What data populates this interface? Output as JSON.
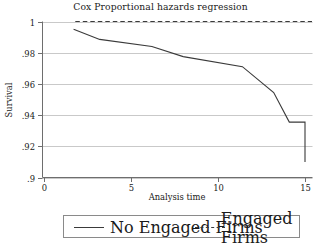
{
  "chart_data": {
    "type": "line",
    "title": "Cox Proportional hazards regression",
    "xlabel": "Analysis time",
    "ylabel": "Survival",
    "xlim": [
      0,
      15
    ],
    "ylim": [
      0.9,
      1.0
    ],
    "xticks": [
      "0",
      "5",
      "10",
      "15"
    ],
    "xtick_values": [
      0,
      5,
      10,
      15
    ],
    "yticks": [
      "1",
      ".98",
      ".96",
      ".94",
      ".92",
      ".9"
    ],
    "ytick_values": [
      1,
      0.98,
      0.96,
      0.94,
      0.92,
      0.9
    ],
    "grid": "horizontal",
    "legend_position": "below-plot",
    "series": [
      {
        "name": "No Engaged Firms",
        "style": "solid",
        "color": "#3a3a3a",
        "step": "post",
        "x": [
          1.7,
          1.7,
          3.2,
          3.2,
          6.2,
          6.2,
          8.0,
          8.0,
          11.4,
          11.4,
          13.2,
          13.2,
          14.1,
          14.1,
          15.0,
          15.0
        ],
        "y": [
          0.995,
          0.995,
          0.9885,
          0.9885,
          0.984,
          0.984,
          0.9775,
          0.9775,
          0.971,
          0.971,
          0.9545,
          0.9545,
          0.9355,
          0.9355,
          0.9355,
          0.91
        ]
      },
      {
        "name": "Engaged Firms",
        "style": "dashed",
        "color": "#3a3a3a",
        "step": "post",
        "x": [
          1.8,
          15.4
        ],
        "y": [
          1.0,
          1.0
        ]
      }
    ]
  },
  "legend": {
    "entries": [
      {
        "label": "No Engaged Firms",
        "style": "solid"
      },
      {
        "label": "Engaged Firms",
        "style": "dashed"
      }
    ]
  }
}
